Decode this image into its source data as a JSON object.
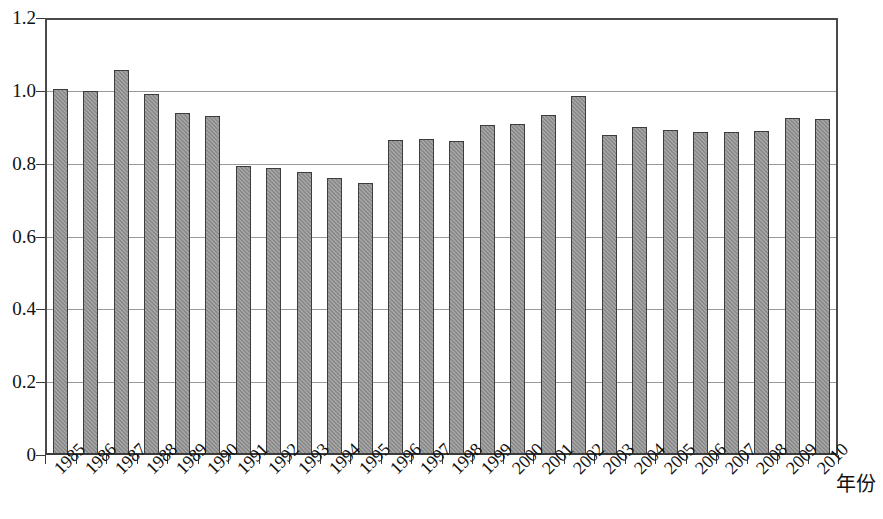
{
  "chart_data": {
    "type": "bar",
    "title": "",
    "subtitle": "",
    "xlabel": "年份",
    "ylabel": "",
    "categories": [
      "1985",
      "1986",
      "1987",
      "1988",
      "1989",
      "1990",
      "1991",
      "1992",
      "1993",
      "1994",
      "1995",
      "1996",
      "1997",
      "1998",
      "1999",
      "2000",
      "2001",
      "2002",
      "2003",
      "2004",
      "2005",
      "2006",
      "2007",
      "2008",
      "2009",
      "2010"
    ],
    "values": [
      1.005,
      1.0,
      1.057,
      0.99,
      0.94,
      0.93,
      0.793,
      0.787,
      0.777,
      0.762,
      0.748,
      0.865,
      0.868,
      0.863,
      0.907,
      0.908,
      0.933,
      0.985,
      0.88,
      0.9,
      0.893,
      0.888,
      0.888,
      0.89,
      0.925,
      0.922
    ],
    "ylim": [
      0,
      1.2
    ],
    "ytick_values": [
      0,
      0.2,
      0.4,
      0.6,
      0.8,
      1.0,
      1.2
    ],
    "ytick_labels": [
      "0",
      "0.2",
      "0.4",
      "0.6",
      "0.8",
      "1.0",
      "1.2"
    ],
    "grid": true,
    "grid_axis": "y",
    "legend": false,
    "legend_position": "none",
    "bar_color": "#8a8a8a",
    "bar_border_color": "#3d3d3d",
    "grid_color": "#9a9a9a",
    "axis_color": "#3a3a3a",
    "x_tick_label_rotation": -45,
    "series": [
      {
        "name": "",
        "values": [
          1.005,
          1.0,
          1.057,
          0.99,
          0.94,
          0.93,
          0.793,
          0.787,
          0.777,
          0.762,
          0.748,
          0.865,
          0.868,
          0.863,
          0.907,
          0.908,
          0.933,
          0.985,
          0.88,
          0.9,
          0.893,
          0.888,
          0.888,
          0.89,
          0.925,
          0.922
        ]
      }
    ]
  }
}
